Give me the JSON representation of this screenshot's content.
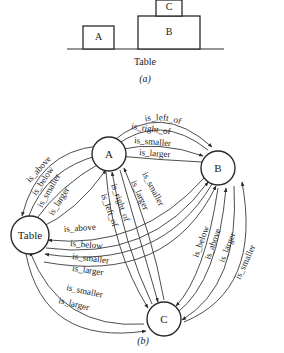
{
  "part_a": {
    "caption": "(a)",
    "table_label": "Table",
    "blocks": [
      {
        "label": "A"
      },
      {
        "label": "B"
      },
      {
        "label": "C"
      }
    ]
  },
  "part_b": {
    "caption": "(b)",
    "nodes": [
      {
        "id": "A",
        "label": "A"
      },
      {
        "id": "B",
        "label": "B"
      },
      {
        "id": "C",
        "label": "C"
      },
      {
        "id": "Table",
        "label": "Table"
      }
    ],
    "edges": {
      "A_B": [
        "is_left_of",
        "is_right_of",
        "is_smaller",
        "is_larger"
      ],
      "A_Table": [
        "is_above",
        "is_below",
        "is_smaller",
        "is_larger"
      ],
      "A_C": [
        "is_left_of",
        "is_right_of",
        "is_larger",
        "is_smaller"
      ],
      "Table_B": [
        "is_above",
        "is_below",
        "is_smaller",
        "is_larger"
      ],
      "B_C": [
        "is_below",
        "is_above",
        "is_larger",
        "is_smaller"
      ],
      "Table_C": [
        "is_smaller",
        "is_larger"
      ]
    }
  }
}
